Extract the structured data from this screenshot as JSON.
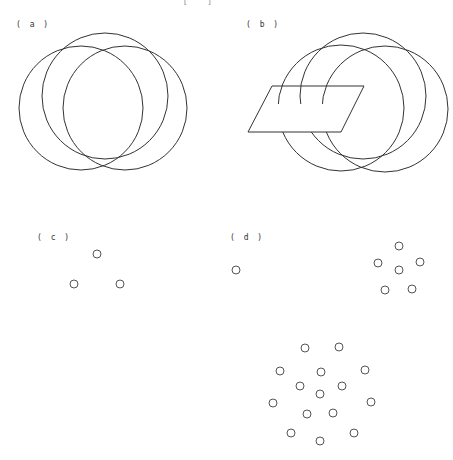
{
  "header_fragment": "[ ]",
  "panels": {
    "a": {
      "label": "( a )",
      "label_pos": [
        16,
        20
      ],
      "circles": [
        {
          "cx": 81,
          "cy": 108,
          "r": 62
        },
        {
          "cx": 105,
          "cy": 96,
          "r": 63
        },
        {
          "cx": 125,
          "cy": 108,
          "r": 62
        }
      ]
    },
    "b": {
      "label": "( b )",
      "label_pos": [
        246,
        20
      ],
      "circles": [
        {
          "cx": 341,
          "cy": 108,
          "r": 63
        },
        {
          "cx": 363,
          "cy": 96,
          "r": 63
        },
        {
          "cx": 385,
          "cy": 109,
          "r": 63
        }
      ],
      "parallelogram": [
        [
          272,
          86
        ],
        [
          364,
          86
        ],
        [
          341,
          132
        ],
        [
          248,
          132
        ]
      ]
    },
    "c": {
      "label": "( c )",
      "label_pos": [
        37,
        233
      ],
      "dots": [
        [
          97,
          254
        ],
        [
          74,
          284
        ],
        [
          120,
          284
        ]
      ]
    },
    "d": {
      "label": "( d )",
      "label_pos": [
        230,
        233
      ],
      "dots_single": [
        [
          236,
          270
        ]
      ],
      "dots_small_cluster": [
        [
          399,
          246
        ],
        [
          378,
          263
        ],
        [
          420,
          262
        ],
        [
          399,
          270
        ],
        [
          385,
          290
        ],
        [
          412,
          289
        ]
      ],
      "dots_large_cluster": [
        [
          305,
          348
        ],
        [
          339,
          347
        ],
        [
          280,
          371
        ],
        [
          321,
          372
        ],
        [
          365,
          370
        ],
        [
          300,
          386
        ],
        [
          342,
          386
        ],
        [
          320,
          394
        ],
        [
          273,
          403
        ],
        [
          371,
          402
        ],
        [
          307,
          414
        ],
        [
          333,
          413
        ],
        [
          291,
          433
        ],
        [
          354,
          433
        ],
        [
          320,
          441
        ]
      ]
    }
  },
  "style": {
    "stroke_color": "#333333",
    "dot_color": "#555555",
    "dot_radius": 4
  }
}
